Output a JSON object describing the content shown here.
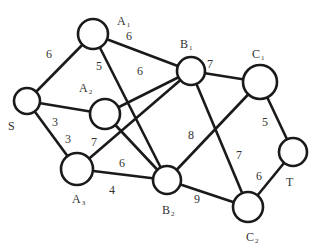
{
  "diagram": {
    "type": "weighted-graph",
    "nodes": [
      {
        "id": "S",
        "label": "S",
        "sub": "",
        "x": 27,
        "y": 101,
        "r": 13,
        "lx": 8,
        "ly": 130
      },
      {
        "id": "A1",
        "label": "A",
        "sub": "1",
        "x": 93,
        "y": 34,
        "r": 15,
        "lx": 117,
        "ly": 25
      },
      {
        "id": "A2",
        "label": "A",
        "sub": "2",
        "x": 105,
        "y": 114,
        "r": 15,
        "lx": 79,
        "ly": 92
      },
      {
        "id": "A3",
        "label": "A",
        "sub": "3",
        "x": 77,
        "y": 169,
        "r": 16,
        "lx": 72,
        "ly": 203
      },
      {
        "id": "B1",
        "label": "B",
        "sub": "1",
        "x": 191,
        "y": 71,
        "r": 14,
        "lx": 180,
        "ly": 48
      },
      {
        "id": "B2",
        "label": "B",
        "sub": "2",
        "x": 167,
        "y": 180,
        "r": 14,
        "lx": 162,
        "ly": 214
      },
      {
        "id": "C1",
        "label": "C",
        "sub": "1",
        "x": 260,
        "y": 82,
        "r": 17,
        "lx": 252,
        "ly": 58
      },
      {
        "id": "C2",
        "label": "C",
        "sub": "2",
        "x": 248,
        "y": 207,
        "r": 15,
        "lx": 246,
        "ly": 241
      },
      {
        "id": "T",
        "label": "T",
        "sub": "",
        "x": 293,
        "y": 152,
        "r": 14,
        "lx": 286,
        "ly": 186
      }
    ],
    "edges": [
      {
        "from": "S",
        "to": "A1",
        "weight": "6",
        "lx": 46,
        "ly": 58
      },
      {
        "from": "S",
        "to": "A2",
        "weight": "3",
        "lx": 52,
        "ly": 126
      },
      {
        "from": "S",
        "to": "A3",
        "weight": "3",
        "lx": 65,
        "ly": 143
      },
      {
        "from": "A1",
        "to": "B1",
        "weight": "6",
        "lx": 126,
        "ly": 40
      },
      {
        "from": "A1",
        "to": "B2",
        "weight": "5",
        "lx": 96,
        "ly": 70
      },
      {
        "from": "A2",
        "to": "B1",
        "weight": "6",
        "lx": 137,
        "ly": 75
      },
      {
        "from": "A2",
        "to": "B2",
        "weight": "",
        "lx": 0,
        "ly": 0
      },
      {
        "from": "A3",
        "to": "B1",
        "weight": "7",
        "lx": 91,
        "ly": 146
      },
      {
        "from": "A3",
        "to": "B2",
        "weight": "6",
        "lx": 119,
        "ly": 167
      },
      {
        "from": "A3",
        "to": "B2b",
        "weight": "4",
        "lx": 109,
        "ly": 194
      },
      {
        "from": "B1",
        "to": "C1",
        "weight": "7",
        "lx": 207,
        "ly": 68
      },
      {
        "from": "B1",
        "to": "C2",
        "weight": "7",
        "lx": 236,
        "ly": 159
      },
      {
        "from": "B2",
        "to": "C1",
        "weight": "8",
        "lx": 188,
        "ly": 139
      },
      {
        "from": "B2",
        "to": "C2",
        "weight": "9",
        "lx": 194,
        "ly": 203
      },
      {
        "from": "C1",
        "to": "T",
        "weight": "5",
        "lx": 262,
        "ly": 126
      },
      {
        "from": "C2",
        "to": "T",
        "weight": "6",
        "lx": 256,
        "ly": 180
      }
    ]
  }
}
